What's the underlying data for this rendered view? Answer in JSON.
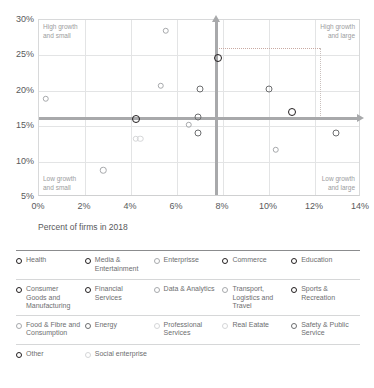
{
  "chart_data": {
    "type": "scatter",
    "title": "",
    "xlabel": "Percent of firms in 2018",
    "ylabel": "",
    "xlim": [
      0,
      14
    ],
    "ylim": [
      5,
      30
    ],
    "xticks": [
      "0%",
      "2%",
      "4%",
      "6%",
      "8%",
      "10%",
      "12%",
      "14%"
    ],
    "yticks": [
      "30%",
      "25%",
      "20%",
      "15%",
      "10%",
      "5%"
    ],
    "grid": true,
    "legend_position": "below",
    "annotations": [
      {
        "name": "quadrant-top-left",
        "text": "High growth\nand small"
      },
      {
        "name": "quadrant-top-right",
        "text": "High growth\nand large"
      },
      {
        "name": "quadrant-bottom-left",
        "text": "Low growth\nand small"
      },
      {
        "name": "quadrant-bottom-right",
        "text": "Low growth\nand large"
      }
    ],
    "reference_lines": {
      "vertical_mean_x": 7.7,
      "horizontal_mean_y": 16.2,
      "dotted_box": {
        "x0": 7.7,
        "x1": 12.2,
        "y": 26.0
      }
    },
    "points": [
      {
        "label": "Health",
        "x": 0.3,
        "y": 18.9,
        "emphasis": "light"
      },
      {
        "label": "Media & Entertainment",
        "x": 5.5,
        "y": 28.5,
        "emphasis": "light"
      },
      {
        "label": "Enterprisse",
        "x": 5.3,
        "y": 20.7,
        "emphasis": "light"
      },
      {
        "label": "Commerce",
        "x": 7.0,
        "y": 20.2,
        "emphasis": "medium"
      },
      {
        "label": "Education",
        "x": 7.8,
        "y": 24.6,
        "emphasis": "dark"
      },
      {
        "label": "Consumer Goods and Manufacturing",
        "x": 4.2,
        "y": 16.0,
        "emphasis": "dark"
      },
      {
        "label": "Financial Services",
        "x": 6.9,
        "y": 16.3,
        "emphasis": "medium"
      },
      {
        "label": "Data & Analytics",
        "x": 6.5,
        "y": 15.2,
        "emphasis": "light"
      },
      {
        "label": "Transport, Logistics and Travel",
        "x": 10.3,
        "y": 11.7,
        "emphasis": "light"
      },
      {
        "label": "Sports & Recreation",
        "x": 10.0,
        "y": 20.2,
        "emphasis": "medium"
      },
      {
        "label": "Food & Fibre and Consumption",
        "x": 4.2,
        "y": 13.2,
        "emphasis": "faint"
      },
      {
        "label": "Energy",
        "x": 4.4,
        "y": 13.2,
        "emphasis": "faint"
      },
      {
        "label": "Professional Services",
        "x": 2.8,
        "y": 8.8,
        "emphasis": "light"
      },
      {
        "label": "Real Eatate",
        "x": 6.9,
        "y": 14.0,
        "emphasis": "medium"
      },
      {
        "label": "Safety & Public Service",
        "x": 11.0,
        "y": 17.0,
        "emphasis": "dark"
      },
      {
        "label": "Other",
        "x": 12.9,
        "y": 14.0,
        "emphasis": "medium"
      }
    ]
  },
  "legend": {
    "rows": [
      [
        {
          "label": "Health",
          "emphasis": "dark"
        },
        {
          "label": "Media & Entertainment",
          "emphasis": "dark"
        },
        {
          "label": "Enterprisse",
          "emphasis": "light"
        },
        {
          "label": "Commerce",
          "emphasis": "dark"
        },
        {
          "label": "Education",
          "emphasis": "dark"
        }
      ],
      [
        {
          "label": "Consumer Goods and Manufacturing",
          "emphasis": "dark"
        },
        {
          "label": "Financial Services",
          "emphasis": "dark"
        },
        {
          "label": "Data & Analytics",
          "emphasis": "light"
        },
        {
          "label": "Transport, Logistics and Travel",
          "emphasis": "light"
        },
        {
          "label": "Sports & Recreation",
          "emphasis": "dark"
        }
      ],
      [
        {
          "label": "Food & Fibre and Consumption",
          "emphasis": "light"
        },
        {
          "label": "Energy",
          "emphasis": "medium"
        },
        {
          "label": "Professional Services",
          "emphasis": "faint"
        },
        {
          "label": "Real Eatate",
          "emphasis": "faint"
        },
        {
          "label": "Safety & Public Service",
          "emphasis": "medium"
        }
      ],
      [
        {
          "label": "Other",
          "emphasis": "dark"
        },
        {
          "label": "Social enterprise",
          "emphasis": "faint"
        }
      ]
    ]
  },
  "colors": {
    "dark": "#231f20",
    "medium": "#6d6e70",
    "light": "#a7a9ac",
    "faint": "#d5d6d8",
    "grid": "#e3e4e5",
    "mean_line": "#a8a9ab",
    "text": "#58595b"
  }
}
